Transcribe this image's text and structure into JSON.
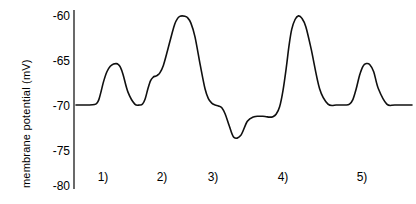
{
  "chart_data": {
    "type": "line",
    "title": "",
    "xlabel": "",
    "ylabel": "membrane potential (mV)",
    "ylim": [
      -80,
      -60
    ],
    "yticks": [
      -60,
      -65,
      -70,
      -75,
      -80
    ],
    "ytick_labels": [
      "-60",
      "-65",
      "-70",
      "-75",
      "-80"
    ],
    "grid": false,
    "legend": "none",
    "baseline_value": -70,
    "xlim": [
      0,
      100
    ],
    "x_annotations": [
      {
        "label": "1)",
        "x": 8.8
      },
      {
        "label": "2)",
        "x": 26.4
      },
      {
        "label": "3)",
        "x": 41.5
      },
      {
        "label": "4)",
        "x": 61.2
      },
      {
        "label": "5)",
        "x": 84.0
      }
    ],
    "series": [
      {
        "name": "membrane potential trace",
        "x": [
          0.0,
          2.0,
          4.0,
          5.5,
          6.2,
          6.8,
          7.4,
          8.2,
          9.2,
          10.2,
          11.2,
          12.0,
          12.6,
          13.2,
          14.0,
          15.5,
          17.5,
          19.0,
          19.8,
          20.6,
          21.4,
          22.2,
          23.0,
          23.6,
          24.2,
          25.0,
          26.0,
          27.2,
          28.4,
          29.4,
          30.2,
          30.9,
          31.6,
          32.4,
          33.2,
          34.2,
          35.4,
          37.0,
          38.4,
          39.4,
          40.4,
          41.4,
          42.4,
          43.4,
          44.4,
          45.6,
          47.0,
          49.0,
          51.0,
          53.0,
          54.6,
          55.6,
          56.6,
          57.6,
          58.6,
          59.6,
          60.6,
          61.6,
          62.6,
          63.4,
          64.2,
          65.2,
          66.2,
          67.2,
          68.4,
          70.0,
          72.5,
          75.0,
          77.5,
          79.0,
          80.2,
          81.4,
          82.4,
          83.4,
          84.4,
          85.4,
          86.4,
          87.4,
          88.6,
          90.0,
          92.5,
          95.0,
          100.0
        ],
        "y": [
          -70.0,
          -70.0,
          -70.0,
          -69.95,
          -69.8,
          -69.4,
          -68.6,
          -67.4,
          -66.3,
          -65.7,
          -65.45,
          -65.4,
          -65.5,
          -65.8,
          -66.6,
          -68.6,
          -69.9,
          -70.0,
          -69.9,
          -69.3,
          -68.2,
          -67.3,
          -66.9,
          -66.8,
          -66.7,
          -66.4,
          -65.6,
          -64.0,
          -62.3,
          -61.0,
          -60.4,
          -60.15,
          -60.1,
          -60.15,
          -60.3,
          -60.9,
          -62.4,
          -65.6,
          -68.2,
          -69.3,
          -69.8,
          -70.0,
          -70.1,
          -70.3,
          -71.0,
          -72.3,
          -73.6,
          -73.4,
          -71.8,
          -71.3,
          -71.25,
          -71.25,
          -71.3,
          -71.35,
          -71.3,
          -71.0,
          -70.2,
          -68.4,
          -65.8,
          -63.4,
          -61.6,
          -60.5,
          -60.1,
          -60.35,
          -61.3,
          -63.8,
          -68.2,
          -69.9,
          -70.0,
          -70.0,
          -70.0,
          -69.9,
          -69.4,
          -68.2,
          -66.7,
          -65.7,
          -65.4,
          -65.5,
          -66.3,
          -68.2,
          -69.9,
          -70.0,
          -70.0
        ]
      }
    ]
  },
  "axis": {
    "y_axis_name": "y-axis-vertical-line"
  }
}
